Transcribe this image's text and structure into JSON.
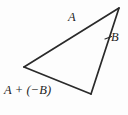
{
  "figure": {
    "kind": "vector-subtraction-triangle-diagram",
    "background_color": "#fdfdfd",
    "stroke_color": "#2a2a2a",
    "text_color": "#1e1e1e",
    "width": 128,
    "height": 115
  },
  "labels": {
    "vector_a": "A",
    "vector_b": "B",
    "resultant": "A + (−B)"
  },
  "geometry": {
    "vertices": {
      "top_right": {
        "x": 119,
        "y": 8
      },
      "left": {
        "x": 24,
        "y": 67
      },
      "bottom": {
        "x": 91,
        "y": 94
      }
    },
    "edges": [
      {
        "name": "edge-a",
        "from": "left",
        "to": "top_right",
        "label": "A"
      },
      {
        "name": "edge-b",
        "from": "top_right",
        "to": "bottom",
        "label": "B"
      },
      {
        "name": "edge-resultant",
        "from": "left",
        "to": "bottom",
        "label": "A + (−B)"
      }
    ],
    "leader_tick": {
      "x1": 105,
      "y1": 39,
      "x2": 111,
      "y2": 36
    }
  }
}
